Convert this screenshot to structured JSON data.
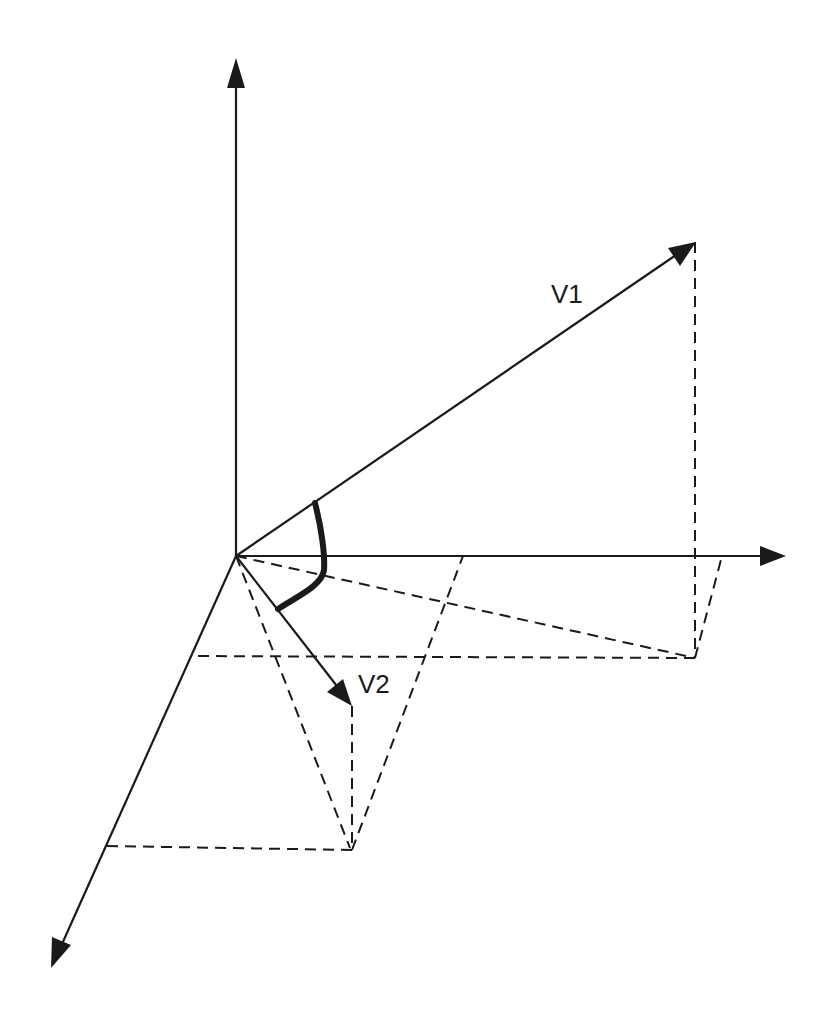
{
  "figure": {
    "labels": {
      "v1": "V1",
      "v2": "V2"
    },
    "colors": {
      "stroke": "#1a1a1a",
      "background": "#ffffff"
    },
    "origin": [
      236,
      556
    ],
    "axes": {
      "y_axis": {
        "from": [
          236,
          556
        ],
        "to": [
          236,
          60
        ]
      },
      "x_axis": {
        "from": [
          236,
          556
        ],
        "to": [
          780,
          556
        ]
      },
      "z_axis": {
        "from": [
          236,
          556
        ],
        "to": [
          52,
          967
        ]
      }
    },
    "vectors": {
      "v1": {
        "from": [
          236,
          556
        ],
        "to": [
          695,
          242
        ]
      },
      "v2": {
        "from": [
          236,
          556
        ],
        "to": [
          352,
          706
        ]
      }
    },
    "angle_arc": {
      "description": "thick curved arc marking the angle between V1 and V2"
    }
  }
}
